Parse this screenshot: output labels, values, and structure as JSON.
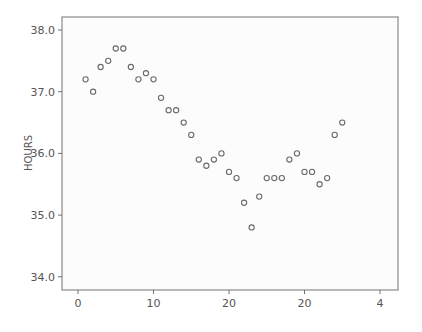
{
  "chart_data": {
    "type": "scatter",
    "title": "",
    "xlabel": "",
    "ylabel": "HOURS",
    "xlim": [
      -3,
      41.5
    ],
    "ylim": [
      33.8,
      38.2
    ],
    "x_ticks": [
      {
        "value": 0,
        "label": "0"
      },
      {
        "value": 10,
        "label": "10"
      },
      {
        "value": 20,
        "label": "20"
      },
      {
        "value": 30,
        "label": "20"
      },
      {
        "value": 40,
        "label": "4"
      }
    ],
    "y_ticks": [
      {
        "value": 34.0,
        "label": "34.0"
      },
      {
        "value": 35.0,
        "label": "35.0"
      },
      {
        "value": 36.0,
        "label": "36.0"
      },
      {
        "value": 37.0,
        "label": "37.0"
      },
      {
        "value": 38.0,
        "label": "38.0"
      }
    ],
    "grid": false,
    "legend": null,
    "series": [
      {
        "name": "HOURS",
        "marker": "open-circle",
        "x": [
          1,
          2,
          3,
          4,
          5,
          6,
          7,
          8,
          9,
          10,
          11,
          12,
          13,
          14,
          15,
          16,
          17,
          18,
          19,
          20,
          21,
          22,
          23,
          24,
          25,
          26,
          27,
          28,
          29,
          30,
          31,
          32,
          33,
          34,
          35
        ],
        "y": [
          37.2,
          37.0,
          37.4,
          37.5,
          37.7,
          37.7,
          37.4,
          37.2,
          37.3,
          37.2,
          36.9,
          36.7,
          36.7,
          36.5,
          36.3,
          35.9,
          35.8,
          35.9,
          36.0,
          35.7,
          35.6,
          35.2,
          34.8,
          35.3,
          35.6,
          35.6,
          35.6,
          35.9,
          36.0,
          35.7,
          35.7,
          35.5,
          35.6,
          36.3,
          36.5
        ]
      }
    ]
  },
  "colors": {
    "background": "#ffffff",
    "plot_background": "#fcfcfc",
    "axis": "#6e6e6e",
    "frame": "#8a8a8a",
    "marker": "#6a6a6a",
    "text": "#555555"
  }
}
